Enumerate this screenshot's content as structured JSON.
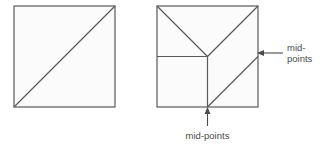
{
  "figure": {
    "background_color": "#ffffff",
    "stroke_color": "#5a5a5a",
    "fill_color": "#fbfbfb",
    "text_color": "#4a4a4a"
  },
  "left_square": {
    "name": "plain-square-with-diagonal",
    "x": 14,
    "y": 6,
    "size": 101,
    "diagonal": "bottom-left-to-top-right"
  },
  "right_square": {
    "name": "dissected-square",
    "x": 157,
    "y": 6,
    "size": 101,
    "cuts": [
      "top-left-corner-to-center",
      "top-right-corner-to-center",
      "left-midpoint-to-center",
      "center-to-bottom-midpoint",
      "bottom-midpoint-to-right-midpoint"
    ]
  },
  "labels": {
    "right": {
      "line1": "mid-",
      "line2": "points",
      "arrow": "left-arrow"
    },
    "bottom": {
      "line1": "mid-points",
      "arrow": "up-arrow"
    }
  }
}
